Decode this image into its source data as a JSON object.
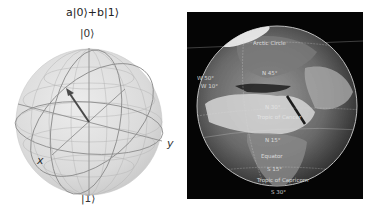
{
  "bloch_sphere": {
    "title": "a|0⟩+b|1⟩",
    "north_label": "|0⟩",
    "south_label": "|1⟩",
    "x_axis_label": "x",
    "y_axis_label": "y",
    "sphere_color": "#d8d8d8",
    "wire_color": "#8a8a8a",
    "vector_color": "#4a4a4a"
  },
  "globe": {
    "background": "#050505",
    "labels": {
      "arctic": "Arctic Circle",
      "w50": "W 50°",
      "w10": "W 10°",
      "n45": "N 45°",
      "n30": "N 30°",
      "cancer": "Tropic of Cancer",
      "n15": "N 15°",
      "equator": "Equator",
      "s15": "S 15°",
      "capricorn": "Tropic of Capricorn",
      "s30": "S 30°"
    }
  }
}
